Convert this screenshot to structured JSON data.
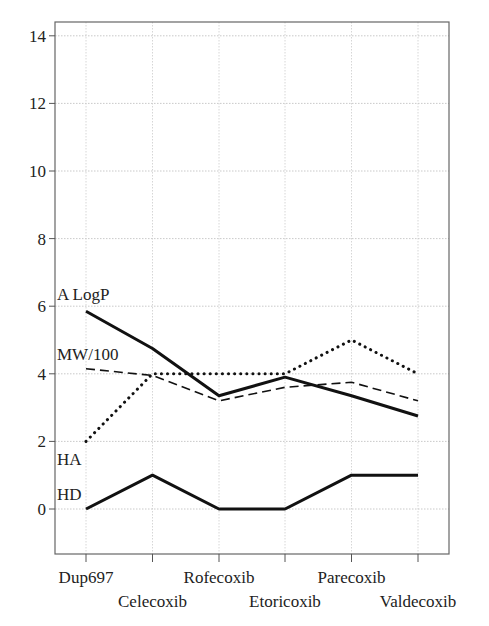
{
  "chart_data": {
    "type": "line",
    "title": "",
    "xlabel": "",
    "ylabel": "",
    "categories": [
      "Dup697",
      "Celecoxib",
      "Rofecoxib",
      "Etoricoxib",
      "Parecoxib",
      "Valdecoxib"
    ],
    "ylim": [
      -1.3,
      14.4
    ],
    "yticks": [
      0,
      2,
      4,
      6,
      8,
      10,
      12,
      14
    ],
    "grid": true,
    "legend": "inline labels at left",
    "series": [
      {
        "name": "A LogP",
        "style": "solid-thick",
        "values": [
          5.85,
          4.75,
          3.35,
          3.9,
          3.35,
          2.75
        ]
      },
      {
        "name": "MW/100",
        "style": "dashed",
        "values": [
          4.15,
          3.95,
          3.2,
          3.6,
          3.75,
          3.2
        ]
      },
      {
        "name": "HA",
        "style": "dotted",
        "values": [
          2,
          4,
          4,
          4,
          5,
          4
        ]
      },
      {
        "name": "HD",
        "style": "solid-thick",
        "values": [
          0,
          1,
          0,
          0,
          1,
          1
        ]
      }
    ]
  },
  "colors": {
    "line": "#111111",
    "grid": "#bbbbbb",
    "frame": "#555555",
    "text": "#222222"
  }
}
